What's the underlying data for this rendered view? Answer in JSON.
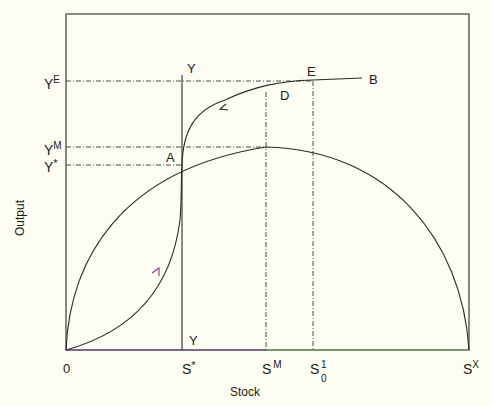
{
  "diagram": {
    "type": "economic-phase-diagram",
    "axes": {
      "xlabel": "Stock",
      "ylabel": "Output",
      "origin_label": "0"
    },
    "x_ticks": [
      {
        "id": "s_star",
        "base": "S",
        "sup": "*",
        "sub": ""
      },
      {
        "id": "s_m",
        "base": "S",
        "sup": "M",
        "sub": ""
      },
      {
        "id": "s_0_1",
        "base": "S",
        "sup": "1",
        "sub": "0"
      },
      {
        "id": "s_x",
        "base": "S",
        "sup": "X",
        "sub": ""
      }
    ],
    "y_ticks": [
      {
        "id": "y_e",
        "base": "Y",
        "sup": "E"
      },
      {
        "id": "y_m",
        "base": "Y",
        "sup": "M"
      },
      {
        "id": "y_star",
        "base": "Y",
        "sup": "*"
      }
    ],
    "points": {
      "A": "A",
      "B": "B",
      "D": "D",
      "E": "E"
    },
    "vertical_line_labels": {
      "top": "Y",
      "bottom": "Y"
    },
    "curves": [
      {
        "name": "growth-curve",
        "description": "Hump-shaped sustainable yield curve from 0 to S^X peaking at S^M, Y^M"
      },
      {
        "name": "adjustment-path",
        "description": "S-shaped path from origin through A to B, arrows indicating direction"
      },
      {
        "name": "y-vertical-line",
        "description": "Vertical line YY at S*"
      }
    ],
    "colors": {
      "background": "#fdfdf3",
      "line": "#2a2a2a",
      "dashed": "#3a3a3a",
      "arrow_low": "#8a3a7a",
      "axis_bottom_right": "#6aa85a"
    }
  }
}
